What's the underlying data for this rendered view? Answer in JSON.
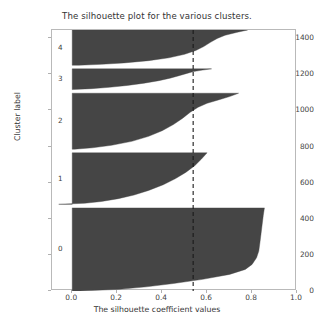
{
  "figure": {
    "title": "The silhouette plot for the various clusters.",
    "width": 314,
    "height": 327
  },
  "axis": {
    "xlabel": "The silhouette coefficient values",
    "ylabel": "Cluster label",
    "xticks": [
      "0.0",
      "0.2",
      "0.4",
      "0.6",
      "0.8",
      "1.0"
    ],
    "yticks": [
      "0",
      "200",
      "400",
      "600",
      "800",
      "1000",
      "1200",
      "1400"
    ]
  },
  "cluster_labels": [
    "0",
    "1",
    "2",
    "3",
    "4"
  ],
  "colors": {
    "fill": "#454545",
    "spine": "#b9b9b9",
    "avg_line": "#1a1a1a",
    "background": "#ffffff",
    "text": "#3a3a3a"
  },
  "chart_data": {
    "type": "area",
    "title": "The silhouette plot for the various clusters.",
    "xlabel": "The silhouette coefficient values",
    "ylabel": "Cluster label",
    "xlim": [
      -0.09,
      1.0
    ],
    "ylim": [
      0,
      1445
    ],
    "xticks": [
      0.0,
      0.2,
      0.4,
      0.6,
      0.8,
      1.0
    ],
    "yticks": [
      0,
      200,
      400,
      600,
      800,
      1000,
      1200,
      1400
    ],
    "grid": false,
    "legend": "none",
    "average_silhouette_score": 0.538,
    "annotations": [
      {
        "type": "vline",
        "value": 0.538,
        "style": "dashed",
        "color": "#1a1a1a"
      }
    ],
    "n_samples": 1445,
    "n_clusters": 5,
    "clusters": [
      {
        "label": "0",
        "size": 460,
        "y_start": 0,
        "y_end": 460,
        "label_y": 230,
        "silhouette_min": 0.035,
        "silhouette_max": 0.855,
        "profile": [
          [
            0.0,
            0.855
          ],
          [
            0.09,
            0.85
          ],
          [
            0.2,
            0.845
          ],
          [
            0.31,
            0.84
          ],
          [
            0.42,
            0.835
          ],
          [
            0.52,
            0.83
          ],
          [
            0.6,
            0.82
          ],
          [
            0.68,
            0.8
          ],
          [
            0.74,
            0.77
          ],
          [
            0.8,
            0.7
          ],
          [
            0.86,
            0.58
          ],
          [
            0.91,
            0.45
          ],
          [
            0.95,
            0.33
          ],
          [
            0.98,
            0.21
          ],
          [
            1.0,
            0.035
          ]
        ]
      },
      {
        "label": "1",
        "size": 285,
        "y_start": 480,
        "y_end": 765,
        "label_y": 622,
        "silhouette_min": -0.06,
        "silhouette_max": 0.6,
        "profile": [
          [
            0.0,
            0.6
          ],
          [
            0.12,
            0.575
          ],
          [
            0.25,
            0.545
          ],
          [
            0.38,
            0.505
          ],
          [
            0.5,
            0.46
          ],
          [
            0.62,
            0.405
          ],
          [
            0.73,
            0.34
          ],
          [
            0.82,
            0.275
          ],
          [
            0.89,
            0.205
          ],
          [
            0.945,
            0.13
          ],
          [
            0.98,
            0.055
          ],
          [
            1.0,
            -0.06
          ]
        ]
      },
      {
        "label": "2",
        "size": 310,
        "y_start": 785,
        "y_end": 1095,
        "label_y": 940,
        "silhouette_min": 0.01,
        "silhouette_max": 0.74,
        "profile": [
          [
            0.0,
            0.74
          ],
          [
            0.06,
            0.7
          ],
          [
            0.12,
            0.65
          ],
          [
            0.18,
            0.6
          ],
          [
            0.25,
            0.56
          ],
          [
            0.34,
            0.525
          ],
          [
            0.45,
            0.49
          ],
          [
            0.56,
            0.45
          ],
          [
            0.67,
            0.4
          ],
          [
            0.77,
            0.34
          ],
          [
            0.86,
            0.265
          ],
          [
            0.93,
            0.175
          ],
          [
            0.975,
            0.09
          ],
          [
            1.0,
            0.01
          ]
        ]
      },
      {
        "label": "3",
        "size": 115,
        "y_start": 1115,
        "y_end": 1230,
        "label_y": 1172,
        "silhouette_min": 0.0,
        "silhouette_max": 0.62,
        "profile": [
          [
            0.0,
            0.62
          ],
          [
            0.06,
            0.58
          ],
          [
            0.13,
            0.54
          ],
          [
            0.22,
            0.51
          ],
          [
            0.33,
            0.475
          ],
          [
            0.45,
            0.435
          ],
          [
            0.57,
            0.385
          ],
          [
            0.69,
            0.32
          ],
          [
            0.8,
            0.245
          ],
          [
            0.89,
            0.165
          ],
          [
            0.955,
            0.085
          ],
          [
            1.0,
            0.0
          ]
        ]
      },
      {
        "label": "4",
        "size": 195,
        "y_start": 1250,
        "y_end": 1445,
        "label_y": 1347,
        "silhouette_min": 0.03,
        "silhouette_max": 0.78,
        "profile": [
          [
            0.0,
            0.78
          ],
          [
            0.07,
            0.73
          ],
          [
            0.15,
            0.68
          ],
          [
            0.24,
            0.645
          ],
          [
            0.35,
            0.615
          ],
          [
            0.47,
            0.585
          ],
          [
            0.58,
            0.55
          ],
          [
            0.69,
            0.5
          ],
          [
            0.79,
            0.43
          ],
          [
            0.87,
            0.34
          ],
          [
            0.935,
            0.23
          ],
          [
            0.975,
            0.13
          ],
          [
            1.0,
            0.03
          ]
        ]
      }
    ]
  }
}
